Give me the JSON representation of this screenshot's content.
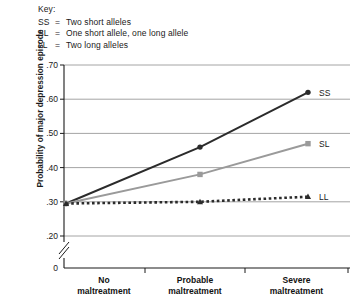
{
  "key": {
    "title": "Key:",
    "entries": [
      {
        "code": "SS",
        "eq": "=",
        "desc": "Two short alleles"
      },
      {
        "code": "SL",
        "eq": "=",
        "desc": "One short allele, one long allele"
      },
      {
        "code": "LL",
        "eq": "=",
        "desc": "Two long alleles"
      }
    ]
  },
  "chart_data": {
    "type": "line",
    "title": "",
    "xlabel": "",
    "ylabel": "Probability of major depression episode",
    "categories": [
      "No\nmaltreatment",
      "Probable\nmaltreatment",
      "Severe\nmaltreatment"
    ],
    "category_lines": [
      [
        "No",
        "maltreatment"
      ],
      [
        "Probable",
        "maltreatment"
      ],
      [
        "Severe",
        "maltreatment"
      ]
    ],
    "ylim": [
      0.2,
      0.7
    ],
    "yticks": [
      0.7,
      0.6,
      0.5,
      0.4,
      0.3,
      0.2
    ],
    "ytick_labels": [
      ".70",
      ".60",
      ".50",
      ".40",
      ".30",
      ".20"
    ],
    "origin_label": "0",
    "axis_break": true,
    "grid": true,
    "legend_position": "right-inline",
    "series": [
      {
        "name": "SS",
        "label": "SS",
        "values": [
          0.295,
          0.46,
          0.62
        ],
        "color": "#2b2b2b",
        "line_style": "solid",
        "marker": "circle"
      },
      {
        "name": "SL",
        "label": "SL",
        "values": [
          0.295,
          0.38,
          0.47
        ],
        "color": "#9a9a9a",
        "line_style": "solid",
        "marker": "square"
      },
      {
        "name": "LL",
        "label": "LL",
        "values": [
          0.295,
          0.3,
          0.315
        ],
        "color": "#2b2b2b",
        "line_style": "dotted",
        "marker": "triangle"
      }
    ]
  }
}
